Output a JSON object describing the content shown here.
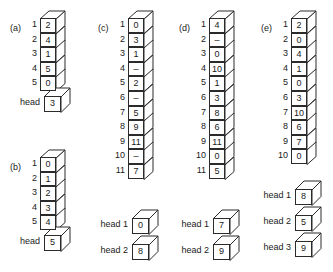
{
  "figure": {
    "title": "",
    "panels": [
      {
        "id": "a",
        "label": "(a)",
        "indices": [
          "1",
          "2",
          "3",
          "4",
          "5"
        ],
        "values": [
          "2",
          "4",
          "1",
          "5",
          "0"
        ],
        "heads": [
          {
            "label": "head",
            "value": "3"
          }
        ]
      },
      {
        "id": "b",
        "label": "(b)",
        "indices": [
          "1",
          "2",
          "3",
          "4",
          "5"
        ],
        "values": [
          "0",
          "1",
          "2",
          "3",
          "4"
        ],
        "heads": [
          {
            "label": "head",
            "value": "5"
          }
        ]
      },
      {
        "id": "c",
        "label": "(c)",
        "indices": [
          "1",
          "2",
          "3",
          "4",
          "5",
          "6",
          "7",
          "8",
          "9",
          "10",
          "11"
        ],
        "values": [
          "0",
          "3",
          "1",
          "–",
          "2",
          "–",
          "5",
          "9",
          "11",
          "–",
          "7"
        ],
        "heads": [
          {
            "label": "head 1",
            "value": "0"
          },
          {
            "label": "head 2",
            "value": "8"
          }
        ]
      },
      {
        "id": "d",
        "label": "(d)",
        "indices": [
          "1",
          "2",
          "3",
          "4",
          "5",
          "6",
          "7",
          "8",
          "9",
          "10",
          "11"
        ],
        "values": [
          "4",
          "–",
          "0",
          "10",
          "1",
          "3",
          "8",
          "6",
          "11",
          "0",
          "5"
        ],
        "heads": [
          {
            "label": "head 1",
            "value": "7"
          },
          {
            "label": "head 2",
            "value": "9"
          }
        ]
      },
      {
        "id": "e",
        "label": "(e)",
        "indices": [
          "1",
          "2",
          "3",
          "4",
          "5",
          "6",
          "7",
          "8",
          "9",
          "10"
        ],
        "values": [
          "2",
          "0",
          "4",
          "1",
          "0",
          "3",
          "10",
          "6",
          "7",
          "0"
        ],
        "heads": [
          {
            "label": "head 1",
            "value": "8"
          },
          {
            "label": "head 2",
            "value": "5"
          },
          {
            "label": "head 3",
            "value": "9"
          }
        ]
      }
    ],
    "colors": {
      "stroke": "#2b2b2b",
      "face": "#ffffff",
      "text": "#1a1a1a",
      "background": "#ffffff"
    }
  }
}
